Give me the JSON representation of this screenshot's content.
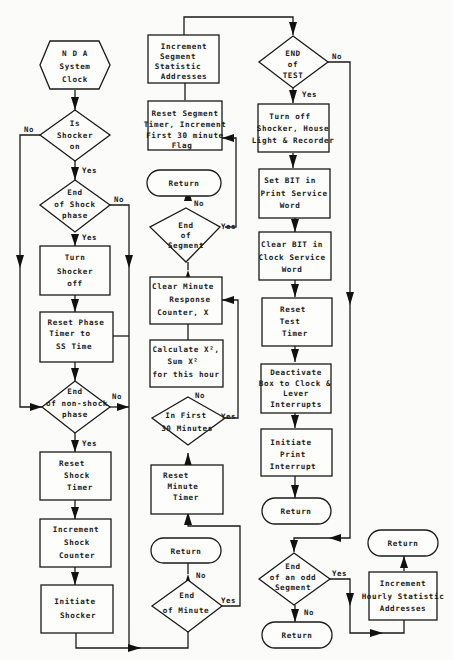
{
  "diagram": {
    "type": "flowchart",
    "col1": {
      "start": [
        "N D A",
        "System",
        "Clock"
      ],
      "d_shocker_on": [
        "Is",
        "Shocker",
        "on"
      ],
      "d_end_shock": [
        "End",
        "of Shock",
        "phase"
      ],
      "b_turn_off": [
        "Turn",
        "Shocker",
        "off"
      ],
      "b_reset_phase": [
        "Reset Phase",
        "Timer to",
        "SS Time"
      ],
      "d_end_nonshock": [
        "End",
        "of non-shock",
        "phase"
      ],
      "b_reset_shock": [
        "Reset",
        "Shock",
        "Timer"
      ],
      "b_inc_shock": [
        "Increment",
        "Shock",
        "Counter"
      ],
      "b_initiate": [
        "Initiate",
        "Shocker"
      ]
    },
    "col2": {
      "b_inc_segment": [
        "Increment",
        "Segment",
        "Statistic",
        "Addresses"
      ],
      "b_reset_segment": [
        "Reset Segment",
        "Timer, Increment",
        "First 30 minute",
        "Flag"
      ],
      "r_return1": "Return",
      "d_end_segment": [
        "End",
        "of",
        "Segment"
      ],
      "b_clear_minute": [
        "Clear Minute",
        "Response",
        "Counter, X"
      ],
      "b_calculate": [
        "Calculate X²,",
        "Sum X²",
        "for this hour"
      ],
      "d_first30": [
        "In First",
        "30 Minutes"
      ],
      "b_reset_minute": [
        "Reset",
        "Minute",
        "Timer"
      ],
      "r_return2": "Return",
      "d_end_minute": [
        "End",
        "of Minute"
      ]
    },
    "col3": {
      "d_end_test": [
        "END",
        "of",
        "TEST"
      ],
      "b_turn_off_all": [
        "Turn off",
        "Shocker, House",
        "Light & Recorder"
      ],
      "b_set_bit": [
        "Set BIT in",
        "Print Service",
        "Word"
      ],
      "b_clear_bit": [
        "Clear BIT in",
        "Clock Service",
        "Word"
      ],
      "b_reset_test": [
        "Reset",
        "Test",
        "Timer"
      ],
      "b_deactivate": [
        "Deactivate",
        "Box to Clock &",
        "Lever",
        "Interrupts"
      ],
      "b_init_print": [
        "Initiate",
        "Print",
        "Interrupt"
      ],
      "r_return3": "Return",
      "d_odd_segment": [
        "End",
        "of an odd",
        "Segment"
      ],
      "r_return4": "Return"
    },
    "col4": {
      "r_return5": "Return",
      "b_inc_hourly": [
        "Increment",
        "Hourly Statistic",
        "Addresses"
      ]
    },
    "labels": {
      "yes": "Yes",
      "no": "No"
    }
  }
}
